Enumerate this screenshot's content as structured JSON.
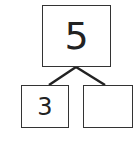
{
  "number_bond": {
    "whole": "5",
    "parts": [
      "3",
      ""
    ]
  }
}
